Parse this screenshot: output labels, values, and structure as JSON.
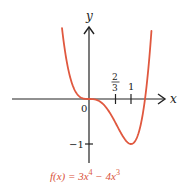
{
  "chart_data": {
    "type": "line",
    "title": "",
    "caption": {
      "prefix": "f(x) = 3x",
      "exp1": "4",
      "mid": " − 4x",
      "exp2": "3"
    },
    "function": "3x^4 - 4x^3",
    "xlabel": "x",
    "ylabel": "y",
    "origin_label": "0",
    "x_ticks": [
      {
        "value": 0.6667,
        "label_num": "2",
        "label_den": "3"
      },
      {
        "value": 1,
        "label": "1"
      }
    ],
    "y_ticks": [
      {
        "value": -1,
        "label": "−1"
      }
    ],
    "xlim": [
      -1.85,
      1.75
    ],
    "ylim": [
      -1.4,
      1.65
    ],
    "grid": false,
    "legend": "none",
    "key_points": [
      {
        "x": 0,
        "y": 0,
        "note": "inflection / stationary point"
      },
      {
        "x": 0.6667,
        "y": -0.5926,
        "note": "inflection point"
      },
      {
        "x": 1,
        "y": -1,
        "note": "minimum"
      },
      {
        "x": 1.3333,
        "y": 0,
        "note": "root"
      }
    ],
    "series": [
      {
        "name": "f(x)",
        "color": "#e0583f",
        "x_range": [
          -0.8,
          1.62
        ]
      }
    ]
  },
  "colors": {
    "curve": "#e0583f",
    "axis": "#222222",
    "caption": "#d9533c"
  }
}
